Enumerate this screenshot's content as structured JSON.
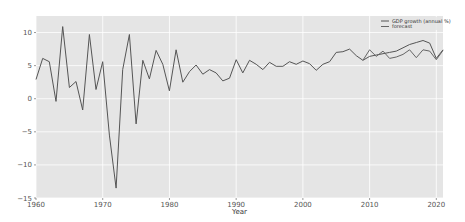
{
  "chart_data": {
    "type": "line",
    "title": "",
    "xlabel": "Year",
    "ylabel": "",
    "xlim": [
      1960,
      2021
    ],
    "ylim": [
      -15,
      12.5
    ],
    "grid": true,
    "legend_position": "upper right",
    "x_ticks": [
      1960,
      1970,
      1980,
      1990,
      2000,
      2010,
      2020
    ],
    "y_ticks": [
      10,
      5,
      0,
      -5,
      -10,
      -15
    ],
    "colors": {
      "background": "#e5e5e5",
      "grid": "#ffffff",
      "line": "#555555",
      "forecast": "#666666"
    },
    "series": [
      {
        "name": "GDP growth (annual %)",
        "x": [
          1960,
          1961,
          1962,
          1963,
          1964,
          1965,
          1966,
          1967,
          1968,
          1969,
          1970,
          1971,
          1972,
          1973,
          1974,
          1975,
          1976,
          1977,
          1978,
          1979,
          1980,
          1981,
          1982,
          1983,
          1984,
          1985,
          1986,
          1987,
          1988,
          1989,
          1990,
          1991,
          1992,
          1993,
          1994,
          1995,
          1996,
          1997,
          1998,
          1999,
          2000,
          2001,
          2002,
          2003,
          2004,
          2005,
          2006,
          2007,
          2008,
          2009,
          2010,
          2011,
          2012,
          2013,
          2014,
          2015,
          2016,
          2017,
          2018,
          2019,
          2020,
          2021
        ],
        "values": [
          2.9,
          6.1,
          5.6,
          -0.4,
          10.9,
          1.7,
          2.6,
          -1.7,
          9.7,
          1.4,
          5.6,
          -5.5,
          -13.5,
          4.4,
          9.7,
          -3.8,
          5.8,
          3.0,
          7.3,
          5.2,
          1.2,
          7.4,
          2.5,
          4.1,
          5.1,
          3.7,
          4.4,
          3.9,
          2.7,
          3.1,
          5.9,
          3.9,
          5.8,
          5.2,
          4.4,
          5.5,
          4.9,
          4.9,
          5.6,
          5.2,
          5.7,
          5.3,
          4.3,
          5.2,
          5.6,
          7.0,
          7.1,
          7.5,
          6.5,
          5.8,
          6.4,
          6.6,
          6.8,
          7.0,
          7.2,
          7.7,
          8.2,
          8.5,
          8.8,
          8.4,
          6.1,
          7.4
        ]
      },
      {
        "name": "forecast",
        "x": [
          2009,
          2010,
          2011,
          2012,
          2013,
          2014,
          2015,
          2016,
          2017,
          2018,
          2019,
          2020,
          2021
        ],
        "values": [
          5.8,
          7.4,
          6.4,
          7.2,
          6.1,
          6.3,
          6.7,
          7.4,
          6.2,
          7.4,
          7.2,
          5.9,
          7.3
        ]
      }
    ]
  },
  "legend": {
    "items": [
      {
        "label": "GDP growth (annual %)"
      },
      {
        "label": "forecast"
      }
    ]
  },
  "axes": {
    "xlabel": "Year",
    "x_tick_labels": [
      "1960",
      "1970",
      "1980",
      "1990",
      "2000",
      "2010",
      "2020"
    ],
    "y_tick_labels": [
      "10",
      "5",
      "0",
      "−15",
      "−5",
      "−10"
    ]
  }
}
